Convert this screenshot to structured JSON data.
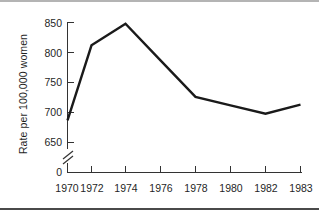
{
  "figure": {
    "type": "line-chart-figure",
    "background": "#ffffff",
    "line_color": "#1a1a1a",
    "axis_color": "#333333"
  },
  "chart_data": {
    "type": "line",
    "title": "",
    "xlabel": "",
    "ylabel": "Rate per 100,000 women",
    "x": [
      1970,
      1972,
      1974,
      1976,
      1978,
      1980,
      1982,
      1983
    ],
    "xtick_labels": [
      "1970",
      "1972",
      "1974",
      "1976",
      "1978",
      "1980",
      "1982",
      "1983"
    ],
    "values": [
      687,
      812,
      848,
      787,
      726,
      712,
      698,
      713
    ],
    "series": [
      {
        "name": "Rate per 100,000 women",
        "values": [
          687,
          812,
          848,
          787,
          726,
          712,
          698,
          713
        ]
      }
    ],
    "ytick_labels": [
      "850",
      "800",
      "750",
      "700",
      "650",
      "0"
    ],
    "ytick_values": [
      850,
      800,
      750,
      700,
      650,
      0
    ],
    "ylim": [
      640,
      860
    ],
    "axis_break": true,
    "axis_break_note": "y-axis broken between 0 and 650",
    "grid": false,
    "legend": false
  },
  "axis": {
    "y_label": "Rate per 100,000 women",
    "ticks_y": [
      {
        "label": "850",
        "value": 850
      },
      {
        "label": "800",
        "value": 800
      },
      {
        "label": "750",
        "value": 750
      },
      {
        "label": "700",
        "value": 700
      },
      {
        "label": "650",
        "value": 650
      },
      {
        "label": "0",
        "value": 0
      }
    ],
    "ticks_x": [
      {
        "label": "1970",
        "value": 1970
      },
      {
        "label": "1972",
        "value": 1972
      },
      {
        "label": "1974",
        "value": 1974
      },
      {
        "label": "1976",
        "value": 1976
      },
      {
        "label": "1978",
        "value": 1978
      },
      {
        "label": "1980",
        "value": 1980
      },
      {
        "label": "1982",
        "value": 1982
      },
      {
        "label": "1983",
        "value": 1983
      }
    ]
  }
}
